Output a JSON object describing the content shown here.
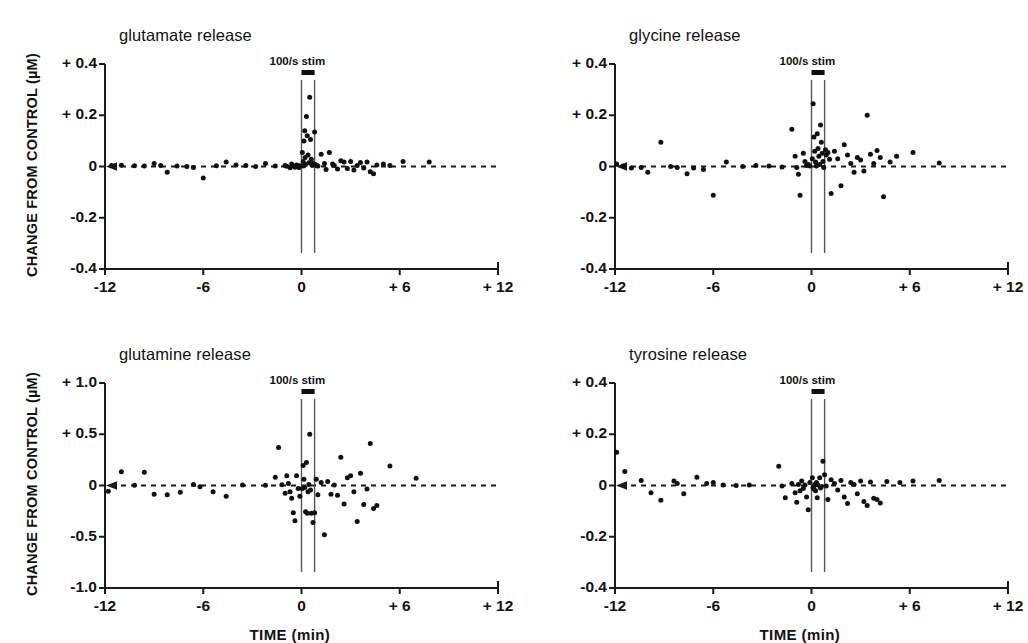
{
  "figure": {
    "xlabel": "TIME (min)",
    "ylabel": "CHANGE FROM CONTROL (µM)",
    "stim_label": "100/s stim"
  },
  "chart_data": [
    {
      "type": "scatter",
      "title": "glutamate release",
      "xlabel": "TIME (min)",
      "ylabel": "CHANGE FROM CONTROL (µM)",
      "xlim": [
        -12,
        12
      ],
      "ylim": [
        -0.4,
        0.4
      ],
      "xticks": [
        -12,
        -6,
        0,
        6,
        12
      ],
      "xticklabels": [
        "-12",
        "-6",
        "0",
        "+ 6",
        "+ 12"
      ],
      "yticks": [
        -0.4,
        -0.2,
        0,
        0.2,
        0.4
      ],
      "yticklabels": [
        "-0.4",
        "-0.2",
        "0",
        "+ 0.2",
        "+ 0.4"
      ],
      "grid": false,
      "zero_line": "dashed",
      "stim_window": [
        0.0,
        0.8
      ],
      "stim_annotation": "100/s stim",
      "points": [
        [
          -11.6,
          0.004
        ],
        [
          -11.0,
          0.005
        ],
        [
          -10.2,
          0.003
        ],
        [
          -9.6,
          0.002
        ],
        [
          -9.0,
          0.012
        ],
        [
          -8.6,
          0.004
        ],
        [
          -8.2,
          -0.022
        ],
        [
          -7.6,
          0.002
        ],
        [
          -7.0,
          0.0
        ],
        [
          -6.6,
          -0.004
        ],
        [
          -6.0,
          -0.045
        ],
        [
          -5.2,
          0.003
        ],
        [
          -4.6,
          0.018
        ],
        [
          -4.0,
          0.006
        ],
        [
          -3.4,
          0.004
        ],
        [
          -2.8,
          0.0
        ],
        [
          -2.2,
          0.012
        ],
        [
          -1.6,
          0.002
        ],
        [
          -1.0,
          0.004
        ],
        [
          -0.9,
          0.001
        ],
        [
          -0.7,
          -0.005
        ],
        [
          -0.6,
          0.01
        ],
        [
          -0.5,
          0.002
        ],
        [
          -0.4,
          -0.003
        ],
        [
          -0.3,
          0.006
        ],
        [
          -0.2,
          0.001
        ],
        [
          -0.15,
          -0.004
        ],
        [
          -0.1,
          0.003
        ],
        [
          0.05,
          0.055
        ],
        [
          0.1,
          0.02
        ],
        [
          0.12,
          0.002
        ],
        [
          0.15,
          0.1
        ],
        [
          0.2,
          0.14
        ],
        [
          0.22,
          0.035
        ],
        [
          0.25,
          0.008
        ],
        [
          0.3,
          0.195
        ],
        [
          0.35,
          0.12
        ],
        [
          0.4,
          0.045
        ],
        [
          0.45,
          0.015
        ],
        [
          0.5,
          0.27
        ],
        [
          0.55,
          0.105
        ],
        [
          0.6,
          0.028
        ],
        [
          0.65,
          0.005
        ],
        [
          0.7,
          0.012
        ],
        [
          0.8,
          0.135
        ],
        [
          0.85,
          0.008
        ],
        [
          0.95,
          0.003
        ],
        [
          1.0,
          0.002
        ],
        [
          1.2,
          0.048
        ],
        [
          1.4,
          0.012
        ],
        [
          1.5,
          -0.012
        ],
        [
          1.7,
          0.055
        ],
        [
          1.9,
          0.01
        ],
        [
          2.0,
          0.004
        ],
        [
          2.2,
          -0.01
        ],
        [
          2.4,
          0.022
        ],
        [
          2.6,
          0.018
        ],
        [
          2.8,
          -0.008
        ],
        [
          3.0,
          0.02
        ],
        [
          3.2,
          -0.014
        ],
        [
          3.4,
          0.004
        ],
        [
          3.6,
          0.016
        ],
        [
          3.8,
          -0.006
        ],
        [
          4.0,
          0.018
        ],
        [
          4.2,
          -0.02
        ],
        [
          4.4,
          -0.028
        ],
        [
          4.6,
          0.006
        ],
        [
          5.0,
          0.01
        ],
        [
          5.4,
          0.004
        ],
        [
          6.2,
          0.02
        ],
        [
          7.8,
          0.018
        ]
      ]
    },
    {
      "type": "scatter",
      "title": "glycine release",
      "xlabel": "TIME (min)",
      "ylabel": "CHANGE FROM CONTROL (µM)",
      "xlim": [
        -12,
        12
      ],
      "ylim": [
        -0.4,
        0.4
      ],
      "xticks": [
        -12,
        -6,
        0,
        6,
        12
      ],
      "xticklabels": [
        "-12",
        "-6",
        "0",
        "+ 6",
        "+ 12"
      ],
      "yticks": [
        -0.4,
        -0.2,
        0,
        0.2,
        0.4
      ],
      "yticklabels": [
        "-0.4",
        "-0.2",
        "0",
        "+ 0.2",
        "+ 0.4"
      ],
      "grid": false,
      "zero_line": "dashed",
      "stim_window": [
        0.0,
        0.8
      ],
      "stim_annotation": "100/s stim",
      "points": [
        [
          -11.9,
          0.01
        ],
        [
          -11.5,
          0.002
        ],
        [
          -11.0,
          -0.006
        ],
        [
          -10.4,
          -0.004
        ],
        [
          -10.0,
          -0.022
        ],
        [
          -9.2,
          0.095
        ],
        [
          -8.6,
          0.0
        ],
        [
          -8.2,
          -0.004
        ],
        [
          -7.6,
          -0.028
        ],
        [
          -7.2,
          -0.006
        ],
        [
          -6.6,
          -0.012
        ],
        [
          -6.0,
          -0.112
        ],
        [
          -5.2,
          0.018
        ],
        [
          -4.2,
          0.0
        ],
        [
          -3.4,
          0.004
        ],
        [
          -2.6,
          0.002
        ],
        [
          -1.8,
          -0.002
        ],
        [
          -1.2,
          0.145
        ],
        [
          -1.0,
          0.04
        ],
        [
          -0.9,
          -0.004
        ],
        [
          -0.8,
          -0.03
        ],
        [
          -0.7,
          -0.112
        ],
        [
          -0.5,
          0.052
        ],
        [
          -0.4,
          0.02
        ],
        [
          -0.3,
          0.004
        ],
        [
          -0.2,
          0.008
        ],
        [
          -0.1,
          0.002
        ],
        [
          0.05,
          0.03
        ],
        [
          0.1,
          0.245
        ],
        [
          0.15,
          0.115
        ],
        [
          0.2,
          0.06
        ],
        [
          0.25,
          0.018
        ],
        [
          0.3,
          0.002
        ],
        [
          0.35,
          0.128
        ],
        [
          0.4,
          0.07
        ],
        [
          0.45,
          0.04
        ],
        [
          0.5,
          0.008
        ],
        [
          0.55,
          0.162
        ],
        [
          0.6,
          0.095
        ],
        [
          0.65,
          0.052
        ],
        [
          0.7,
          0.02
        ],
        [
          0.75,
          -0.004
        ],
        [
          0.85,
          0.065
        ],
        [
          0.9,
          0.045
        ],
        [
          1.0,
          0.055
        ],
        [
          1.1,
          0.028
        ],
        [
          1.2,
          -0.105
        ],
        [
          1.4,
          0.06
        ],
        [
          1.6,
          0.03
        ],
        [
          1.8,
          -0.075
        ],
        [
          2.0,
          0.085
        ],
        [
          2.2,
          0.045
        ],
        [
          2.4,
          0.012
        ],
        [
          2.6,
          -0.022
        ],
        [
          2.8,
          0.035
        ],
        [
          3.0,
          0.025
        ],
        [
          3.2,
          -0.018
        ],
        [
          3.4,
          0.2
        ],
        [
          3.6,
          0.048
        ],
        [
          3.8,
          0.012
        ],
        [
          4.0,
          0.062
        ],
        [
          4.2,
          0.035
        ],
        [
          4.4,
          -0.118
        ],
        [
          4.8,
          0.018
        ],
        [
          5.2,
          0.04
        ],
        [
          6.2,
          0.055
        ],
        [
          7.8,
          0.014
        ]
      ]
    },
    {
      "type": "scatter",
      "title": "glutamine release",
      "xlabel": "TIME (min)",
      "ylabel": "CHANGE FROM CONTROL (µM)",
      "xlim": [
        -12,
        12
      ],
      "ylim": [
        -1.0,
        1.0
      ],
      "xticks": [
        -12,
        -6,
        0,
        6,
        12
      ],
      "xticklabels": [
        "-12",
        "-6",
        "0",
        "+ 6",
        "+ 12"
      ],
      "yticks": [
        -1.0,
        -0.5,
        0,
        0.5,
        1.0
      ],
      "yticklabels": [
        "-1.0",
        "-0.5",
        "0",
        "+ 0.5",
        "+ 1.0"
      ],
      "grid": false,
      "zero_line": "dashed",
      "stim_window": [
        0.0,
        0.8
      ],
      "stim_annotation": "100/s stim",
      "points": [
        [
          -11.8,
          -0.055
        ],
        [
          -11.0,
          0.135
        ],
        [
          -10.2,
          0.002
        ],
        [
          -9.6,
          0.13
        ],
        [
          -9.0,
          -0.085
        ],
        [
          -8.2,
          -0.09
        ],
        [
          -7.4,
          -0.065
        ],
        [
          -6.6,
          0.01
        ],
        [
          -6.2,
          -0.012
        ],
        [
          -5.4,
          -0.06
        ],
        [
          -4.6,
          -0.105
        ],
        [
          -3.6,
          0.004
        ],
        [
          -2.2,
          0.002
        ],
        [
          -1.6,
          0.08
        ],
        [
          -1.4,
          0.37
        ],
        [
          -1.2,
          0.008
        ],
        [
          -1.0,
          -0.075
        ],
        [
          -0.9,
          0.095
        ],
        [
          -0.8,
          0.02
        ],
        [
          -0.7,
          -0.06
        ],
        [
          -0.6,
          -0.125
        ],
        [
          -0.5,
          -0.265
        ],
        [
          -0.4,
          -0.345
        ],
        [
          -0.3,
          0.095
        ],
        [
          -0.2,
          -0.03
        ],
        [
          -0.1,
          -0.105
        ],
        [
          0.05,
          -0.03
        ],
        [
          0.1,
          0.195
        ],
        [
          0.15,
          0.06
        ],
        [
          0.2,
          -0.02
        ],
        [
          0.25,
          -0.255
        ],
        [
          0.3,
          0.225
        ],
        [
          0.35,
          -0.27
        ],
        [
          0.4,
          -0.06
        ],
        [
          0.45,
          0.01
        ],
        [
          0.5,
          0.5
        ],
        [
          0.55,
          -0.045
        ],
        [
          0.6,
          -0.27
        ],
        [
          0.7,
          -0.36
        ],
        [
          0.8,
          -0.265
        ],
        [
          0.9,
          0.06
        ],
        [
          1.0,
          -0.09
        ],
        [
          1.2,
          0.03
        ],
        [
          1.4,
          -0.48
        ],
        [
          1.6,
          0.04
        ],
        [
          1.8,
          -0.085
        ],
        [
          2.0,
          0.005
        ],
        [
          2.2,
          -0.095
        ],
        [
          2.4,
          0.275
        ],
        [
          2.6,
          -0.18
        ],
        [
          2.8,
          0.075
        ],
        [
          3.0,
          0.095
        ],
        [
          3.2,
          -0.06
        ],
        [
          3.4,
          -0.35
        ],
        [
          3.6,
          0.12
        ],
        [
          3.8,
          -0.185
        ],
        [
          4.0,
          -0.035
        ],
        [
          4.2,
          0.41
        ],
        [
          4.4,
          -0.225
        ],
        [
          4.6,
          -0.195
        ],
        [
          5.4,
          0.19
        ],
        [
          7.0,
          0.07
        ]
      ]
    },
    {
      "type": "scatter",
      "title": "tyrosine release",
      "xlabel": "TIME (min)",
      "ylabel": "CHANGE FROM CONTROL (µM)",
      "xlim": [
        -12,
        12
      ],
      "ylim": [
        -0.4,
        0.4
      ],
      "xticks": [
        -12,
        -6,
        0,
        6,
        12
      ],
      "xticklabels": [
        "-12",
        "-6",
        "0",
        "+ 6",
        "+ 12"
      ],
      "yticks": [
        -0.4,
        -0.2,
        0,
        0.2,
        0.4
      ],
      "yticklabels": [
        "-0.4",
        "-0.2",
        "0",
        "+ 0.2",
        "+ 0.4"
      ],
      "grid": false,
      "zero_line": "dashed",
      "stim_window": [
        0.0,
        0.8
      ],
      "stim_annotation": "100/s stim",
      "points": [
        [
          -11.9,
          0.13
        ],
        [
          -11.4,
          0.055
        ],
        [
          -10.4,
          0.02
        ],
        [
          -9.8,
          -0.028
        ],
        [
          -9.2,
          -0.058
        ],
        [
          -8.4,
          0.018
        ],
        [
          -8.2,
          0.008
        ],
        [
          -7.8,
          -0.032
        ],
        [
          -7.0,
          0.032
        ],
        [
          -6.4,
          0.008
        ],
        [
          -6.0,
          0.012
        ],
        [
          -5.4,
          0.002
        ],
        [
          -4.6,
          0.0
        ],
        [
          -3.8,
          0.002
        ],
        [
          -2.0,
          0.075
        ],
        [
          -1.8,
          -0.002
        ],
        [
          -1.6,
          -0.048
        ],
        [
          -1.2,
          0.008
        ],
        [
          -1.0,
          -0.028
        ],
        [
          -0.9,
          -0.065
        ],
        [
          -0.8,
          0.004
        ],
        [
          -0.7,
          -0.02
        ],
        [
          -0.6,
          0.018
        ],
        [
          -0.5,
          -0.012
        ],
        [
          -0.4,
          0.002
        ],
        [
          -0.3,
          -0.045
        ],
        [
          -0.2,
          -0.095
        ],
        [
          -0.1,
          0.012
        ],
        [
          0.05,
          0.03
        ],
        [
          0.1,
          -0.008
        ],
        [
          0.15,
          -0.014
        ],
        [
          0.2,
          0.004
        ],
        [
          0.25,
          -0.02
        ],
        [
          0.3,
          0.012
        ],
        [
          0.35,
          -0.048
        ],
        [
          0.4,
          0.002
        ],
        [
          0.5,
          0.03
        ],
        [
          0.55,
          -0.01
        ],
        [
          0.6,
          -0.005
        ],
        [
          0.7,
          0.095
        ],
        [
          0.8,
          0.042
        ],
        [
          0.9,
          -0.002
        ],
        [
          1.0,
          -0.055
        ],
        [
          1.2,
          0.022
        ],
        [
          1.4,
          0.008
        ],
        [
          1.6,
          -0.018
        ],
        [
          1.8,
          0.02
        ],
        [
          2.0,
          -0.045
        ],
        [
          2.2,
          -0.07
        ],
        [
          2.4,
          0.012
        ],
        [
          2.6,
          0.004
        ],
        [
          2.8,
          -0.032
        ],
        [
          3.0,
          0.018
        ],
        [
          3.2,
          -0.062
        ],
        [
          3.4,
          -0.078
        ],
        [
          3.6,
          0.014
        ],
        [
          3.8,
          -0.05
        ],
        [
          4.0,
          -0.055
        ],
        [
          4.2,
          -0.068
        ],
        [
          4.6,
          0.016
        ],
        [
          5.4,
          0.012
        ],
        [
          6.2,
          0.018
        ],
        [
          7.8,
          0.02
        ]
      ]
    }
  ]
}
